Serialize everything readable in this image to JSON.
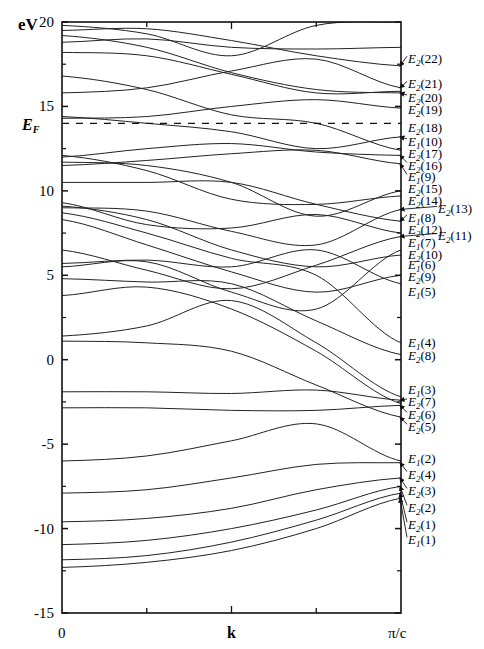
{
  "chart_data": {
    "type": "line",
    "title": "",
    "xlabel": "k",
    "ylabel": "eV",
    "xlim": [
      0,
      1
    ],
    "ylim": [
      -15,
      20
    ],
    "x_tick_labels": [
      "0",
      "k",
      "π/c"
    ],
    "y_ticks": [
      20,
      15,
      10,
      5,
      0,
      -5,
      -10,
      -15
    ],
    "y_tick_labels": [
      "20",
      "15",
      "10",
      "5",
      "0",
      "-5",
      "-10",
      "-15"
    ],
    "minor_y_ticks": [
      17.5,
      12.5,
      7.5,
      2.5,
      -2.5,
      -7.5,
      -12.5
    ],
    "x_minor_ticks": [
      0.25,
      0.5,
      0.75
    ],
    "grid": false,
    "fermi_level": {
      "label": "E_F",
      "value": 14.0,
      "style": "dashed"
    },
    "x_samples": [
      0,
      0.25,
      0.5,
      0.75,
      1.0
    ],
    "series": [
      {
        "name": "v1",
        "values": [
          -12.3,
          -12.0,
          -11.3,
          -10.0,
          -8.2
        ]
      },
      {
        "name": "v2",
        "values": [
          -11.85,
          -11.6,
          -10.8,
          -9.5,
          -7.9
        ]
      },
      {
        "name": "v3",
        "values": [
          -10.95,
          -10.7,
          -10.0,
          -8.9,
          -7.5
        ]
      },
      {
        "name": "v4",
        "values": [
          -9.6,
          -9.4,
          -8.8,
          -7.7,
          -7.0
        ]
      },
      {
        "name": "v5",
        "values": [
          -7.9,
          -7.7,
          -7.0,
          -6.2,
          -6.1
        ]
      },
      {
        "name": "v6",
        "values": [
          -6.0,
          -5.7,
          -4.8,
          -3.8,
          -6.0
        ]
      },
      {
        "name": "v7",
        "values": [
          -2.85,
          -2.85,
          -3.0,
          -3.0,
          -2.7
        ]
      },
      {
        "name": "v8",
        "values": [
          -1.9,
          -1.9,
          -2.0,
          -1.8,
          -2.4
        ]
      },
      {
        "name": "b9",
        "values": [
          1.1,
          1.0,
          0.5,
          -1.5,
          -3.4
        ]
      },
      {
        "name": "b10",
        "values": [
          1.4,
          2.0,
          3.5,
          1.0,
          -2.2
        ]
      },
      {
        "name": "b11",
        "values": [
          3.8,
          4.3,
          3.0,
          0.5,
          -2.6
        ]
      },
      {
        "name": "b12",
        "values": [
          4.8,
          4.6,
          4.5,
          2.3,
          0.3
        ]
      },
      {
        "name": "b13",
        "values": [
          5.5,
          5.8,
          4.0,
          3.0,
          6.5
        ]
      },
      {
        "name": "b14",
        "values": [
          6.5,
          5.3,
          4.2,
          5.6,
          7.3
        ]
      },
      {
        "name": "b15",
        "values": [
          5.7,
          5.9,
          5.5,
          6.5,
          4.5
        ]
      },
      {
        "name": "b16",
        "values": [
          8.3,
          6.8,
          5.2,
          4.0,
          5.0
        ]
      },
      {
        "name": "b17",
        "values": [
          8.7,
          7.5,
          6.0,
          5.0,
          1.0
        ]
      },
      {
        "name": "b18",
        "values": [
          9.1,
          8.3,
          6.5,
          5.5,
          6.2
        ]
      },
      {
        "name": "b19",
        "values": [
          9.3,
          8.0,
          7.8,
          8.6,
          7.5
        ]
      },
      {
        "name": "b20",
        "values": [
          9.0,
          8.8,
          7.6,
          6.8,
          8.9
        ]
      },
      {
        "name": "b21",
        "values": [
          10.5,
          10.5,
          10.5,
          9.2,
          8.2
        ]
      },
      {
        "name": "b22",
        "values": [
          11.5,
          11.8,
          12.2,
          12.4,
          11.6
        ]
      },
      {
        "name": "b23",
        "values": [
          11.7,
          11.5,
          10.5,
          8.5,
          10.0
        ]
      },
      {
        "name": "b24",
        "values": [
          12.1,
          11.2,
          9.5,
          9.2,
          9.7
        ]
      },
      {
        "name": "b25",
        "values": [
          12.0,
          12.5,
          12.8,
          12.3,
          12.1
        ]
      },
      {
        "name": "b26",
        "values": [
          14.3,
          14.4,
          15.0,
          15.4,
          14.9
        ]
      },
      {
        "name": "b27",
        "values": [
          14.4,
          14.0,
          13.5,
          12.5,
          13.2
        ]
      },
      {
        "name": "b28",
        "values": [
          15.8,
          16.1,
          17.1,
          17.8,
          16.1
        ]
      },
      {
        "name": "b29",
        "values": [
          16.8,
          16.0,
          14.5,
          14.0,
          12.4
        ]
      },
      {
        "name": "b30",
        "values": [
          18.2,
          18.0,
          16.9,
          15.8,
          15.9
        ]
      },
      {
        "name": "b31",
        "values": [
          18.8,
          19.0,
          18.5,
          18.4,
          18.5
        ]
      },
      {
        "name": "b32",
        "values": [
          19.2,
          18.5,
          17.0,
          16.0,
          15.8
        ]
      },
      {
        "name": "b33",
        "values": [
          19.5,
          19.6,
          18.9,
          18.0,
          17.4
        ]
      },
      {
        "name": "b34",
        "values": [
          19.8,
          19.3,
          18.0,
          19.8,
          20.0
        ]
      }
    ],
    "right_labels": [
      {
        "main": "E",
        "sub": "2",
        "idx": "(22)",
        "y": 17.4,
        "arrow": true,
        "ty": 17.8
      },
      {
        "main": "E",
        "sub": "2",
        "idx": "(21)",
        "y": 16.1,
        "arrow": true,
        "ty": 16.3
      },
      {
        "main": "E",
        "sub": "2",
        "idx": "(20)",
        "y": 15.8,
        "arrow": true,
        "ty": 15.5
      },
      {
        "main": "E",
        "sub": "2",
        "idx": "(19)",
        "y": 14.9,
        "arrow": false,
        "ty": 14.8
      },
      {
        "main": "E",
        "sub": "2",
        "idx": "(18)",
        "y": 14.0,
        "arrow": false,
        "ty": 13.7
      },
      {
        "main": "E",
        "sub": "1",
        "idx": "(10)",
        "y": 13.2,
        "arrow": true,
        "ty": 12.9
      },
      {
        "main": "E",
        "sub": "2",
        "idx": "(17)",
        "y": 12.4,
        "arrow": false,
        "ty": 12.2
      },
      {
        "main": "E",
        "sub": "2",
        "idx": "(16)",
        "y": 12.1,
        "arrow": true,
        "ty": 11.5
      },
      {
        "main": "E",
        "sub": "1",
        "idx": "(9)",
        "y": 11.6,
        "arrow": true,
        "ty": 10.8
      },
      {
        "main": "E",
        "sub": "2",
        "idx": "(15)",
        "y": 10.0,
        "arrow": false,
        "ty": 10.1
      },
      {
        "main": "E",
        "sub": "2",
        "idx": "(14)",
        "y": 9.7,
        "arrow": false,
        "ty": 9.4
      },
      {
        "main": "E",
        "sub": "2",
        "idx": "(13)",
        "y": 8.9,
        "arrow": true,
        "ty": 8.9,
        "outer": true
      },
      {
        "main": "E",
        "sub": "1",
        "idx": "(8)",
        "y": 8.2,
        "arrow": true,
        "ty": 8.4
      },
      {
        "main": "E",
        "sub": "2",
        "idx": "(12)",
        "y": 7.5,
        "arrow": false,
        "ty": 7.7
      },
      {
        "main": "E",
        "sub": "2",
        "idx": "(11)",
        "y": 7.3,
        "arrow": true,
        "ty": 7.3,
        "outer": true
      },
      {
        "main": "E",
        "sub": "1",
        "idx": "(7)",
        "y": 6.5,
        "arrow": false,
        "ty": 6.9
      },
      {
        "main": "E",
        "sub": "2",
        "idx": "(10)",
        "y": 6.2,
        "arrow": false,
        "ty": 6.2
      },
      {
        "main": "E",
        "sub": "1",
        "idx": "(6)",
        "y": 5.0,
        "arrow": false,
        "ty": 5.6
      },
      {
        "main": "E",
        "sub": "2",
        "idx": "(9)",
        "y": 4.5,
        "arrow": false,
        "ty": 4.9
      },
      {
        "main": "E",
        "sub": "1",
        "idx": "(5)",
        "y": 4.0,
        "arrow": false,
        "ty": 4.0
      },
      {
        "main": "E",
        "sub": "1",
        "idx": "(4)",
        "y": 1.0,
        "arrow": false,
        "ty": 1.0
      },
      {
        "main": "E",
        "sub": "2",
        "idx": "(8)",
        "y": 0.3,
        "arrow": false,
        "ty": 0.2
      },
      {
        "main": "E",
        "sub": "1",
        "idx": "(3)",
        "y": -2.2,
        "arrow": false,
        "ty": -1.8
      },
      {
        "main": "E",
        "sub": "2",
        "idx": "(7)",
        "y": -2.4,
        "arrow": true,
        "ty": -2.5
      },
      {
        "main": "E",
        "sub": "2",
        "idx": "(6)",
        "y": -2.7,
        "arrow": true,
        "ty": -3.3
      },
      {
        "main": "E",
        "sub": "2",
        "idx": "(5)",
        "y": -3.4,
        "arrow": true,
        "ty": -4.0
      },
      {
        "main": "E",
        "sub": "1",
        "idx": "(2)",
        "y": -6.0,
        "arrow": false,
        "ty": -5.9
      },
      {
        "main": "E",
        "sub": "2",
        "idx": "(4)",
        "y": -6.1,
        "arrow": true,
        "ty": -6.8
      },
      {
        "main": "E",
        "sub": "2",
        "idx": "(3)",
        "y": -7.0,
        "arrow": true,
        "ty": -7.8
      },
      {
        "main": "E",
        "sub": "2",
        "idx": "(2)",
        "y": -7.5,
        "arrow": true,
        "ty": -8.8
      },
      {
        "main": "E",
        "sub": "2",
        "idx": "(1)",
        "y": -7.9,
        "arrow": true,
        "ty": -9.8
      },
      {
        "main": "E",
        "sub": "1",
        "idx": "(1)",
        "y": -8.2,
        "arrow": true,
        "ty": -10.7
      }
    ]
  },
  "axis": {
    "y_unit": "eV",
    "x_start": "0",
    "x_mid": "k",
    "x_end": "π/c",
    "fermi_label_main": "E",
    "fermi_label_sub": "F"
  }
}
